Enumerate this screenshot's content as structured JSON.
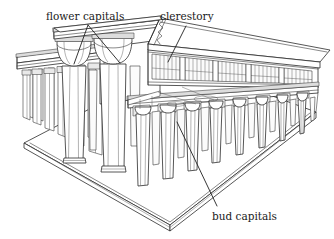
{
  "figure": {
    "background_color": "#ffffff",
    "ink_color": "#2b2b2b",
    "labels": [
      {
        "id": "flower-capitals",
        "text": "flower capitals",
        "x": 46,
        "y": 20,
        "anchor": "start",
        "leader_kind": "forked"
      },
      {
        "id": "clerestory",
        "text": "clerestory",
        "x": 160,
        "y": 20,
        "anchor": "start",
        "leader_kind": "single"
      },
      {
        "id": "bud-capitals",
        "text": "bud capitals",
        "x": 212,
        "y": 220,
        "anchor": "start",
        "leader_kind": "single"
      }
    ],
    "parts": [
      {
        "id": "platform",
        "name": "stepped stone platform"
      },
      {
        "id": "left-colonnade",
        "name": "left side aisle colonnade"
      },
      {
        "id": "nave-columns",
        "name": "central nave columns with open-flower capitals"
      },
      {
        "id": "clerestory-windows",
        "name": "grilled clerestory window band"
      },
      {
        "id": "roof-slab",
        "name": "flat stone roof slabs"
      },
      {
        "id": "right-columns",
        "name": "side aisle columns with closed bud capitals"
      },
      {
        "id": "architrave",
        "name": "architrave beams"
      }
    ]
  }
}
